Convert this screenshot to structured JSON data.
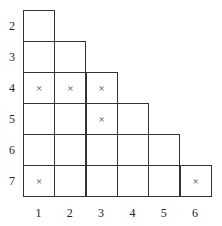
{
  "diagram": {
    "type": "staircase-grid",
    "row_labels": [
      "2",
      "3",
      "4",
      "5",
      "6",
      "7"
    ],
    "col_labels": [
      "1",
      "2",
      "3",
      "4",
      "5",
      "6"
    ],
    "mark_symbol": "×",
    "rows": [
      {
        "label": "2",
        "cells": [
          "",
          ""
        ]
      },
      {
        "label": "3",
        "cells": [
          "",
          "",
          ""
        ]
      },
      {
        "label": "4",
        "cells": [
          "×",
          "×",
          "×",
          ""
        ]
      },
      {
        "label": "5",
        "cells": [
          "",
          "",
          "×",
          "",
          ""
        ]
      },
      {
        "label": "6",
        "cells": [
          "",
          "",
          "",
          "",
          "",
          ""
        ]
      },
      {
        "label": "7",
        "cells": [
          "×",
          "",
          "",
          "",
          "",
          "×"
        ]
      }
    ]
  }
}
